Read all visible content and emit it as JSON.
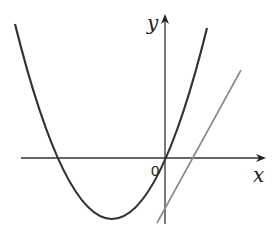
{
  "diagram": {
    "type": "function-graph",
    "axes": {
      "x_label": "x",
      "y_label": "y",
      "origin_label": "0"
    },
    "curves": [
      {
        "name": "parabola",
        "kind": "quadratic",
        "opens": "up",
        "vertex_quadrant": "III",
        "color": "#333333"
      },
      {
        "name": "line",
        "kind": "linear",
        "slope": "positive",
        "color": "#888888"
      }
    ]
  }
}
